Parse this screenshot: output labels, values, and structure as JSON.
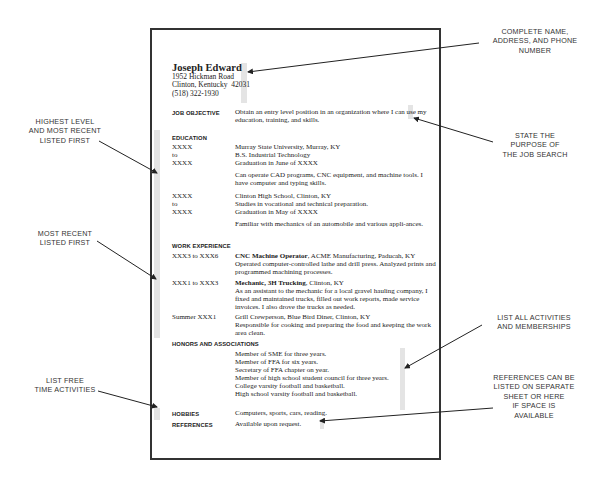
{
  "resume": {
    "name": "Joseph Edward",
    "address": "1952 Hickman Road\nClinton, Kentucky  42031\n(518) 322-1930",
    "job_objective": {
      "heading": "JOB OBJECTIVE",
      "text": "Obtain an entry level position in an organization where I can use my education, training, and skills."
    },
    "education": {
      "heading": "EDUCATION",
      "entries": [
        {
          "dates": "XXXX\nto\nXXXX",
          "lines": "Murray State University, Murray, KY\nB.S. Industrial Technology\nGraduation in June of XXXX",
          "note": "Can operate CAD programs, CNC equipment, and machine tools. I have computer and typing skills."
        },
        {
          "dates": "XXXX\nto\nXXXX",
          "lines": "Clinton High School, Clinton, KY\nStudies in vocational and technical preparation.\nGraduation in May of XXXX",
          "note": "Familiar with mechanics of an automobile and various appli-ances."
        }
      ]
    },
    "work_experience": {
      "heading": "WORK EXPERIENCE",
      "entries": [
        {
          "dates": "XXX3 to XXX6",
          "title": "CNC Machine Operator",
          "employer": ", ACME Manufacturing, Paducah, KY",
          "desc": "Operated computer-controlled lathe and drill press. Analyzed prints and programmed machining processes."
        },
        {
          "dates": "XXX1 to XXX3",
          "title": "Mechanic, 3H Trucking",
          "employer": ", Clinton, KY",
          "desc": "As an assistant to the mechanic for a local gravel hauling company, I fixed and maintained trucks, filled out work reports, made service invoices. I also drove the trucks as needed."
        },
        {
          "dates": "Summer XXX1",
          "title": "",
          "employer": "Grill Crewperson, Blue Bird Diner, Clinton, KY",
          "desc": "Responsible for cooking and preparing the food and keeping the work area clean."
        }
      ]
    },
    "honors": {
      "heading": "HONORS AND ASSOCIATIONS",
      "items": "Member of SME for three years.\nMember of FFA for six years.\nSecretary of FFA chapter on year.\nMember of high school student council for three years.\nCollege varsity football and basketball.\nHigh school varsity football and basketball."
    },
    "hobbies": {
      "heading": "HOBBIES",
      "text": "Computers, sports, cars, reading."
    },
    "references": {
      "heading": "REFERENCES",
      "text": "Available upon request."
    }
  },
  "annotations": {
    "name_address": "COMPLETE NAME,\nADDRESS, AND PHONE\nNUMBER",
    "purpose": "STATE THE\nPURPOSE OF\nTHE JOB SEARCH",
    "highest_level": "HIGHEST LEVEL\nAND MOST RECENT\nLISTED FIRST",
    "most_recent": "MOST RECENT\nLISTED FIRST",
    "activities": "LIST ALL ACTIVITIES\nAND MEMBERSHIPS",
    "free_time": "LIST FREE\nTIME ACTIVITIES",
    "references": "REFERENCES CAN BE\nLISTED ON SEPARATE\nSHEET OR HERE\nIF SPACE IS\nAVAILABLE"
  }
}
